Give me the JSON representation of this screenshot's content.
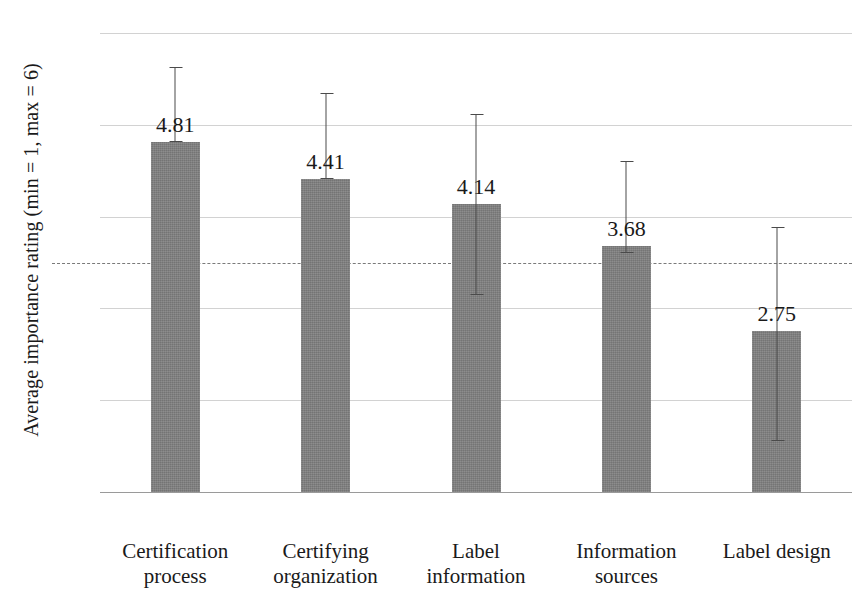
{
  "chart_data": {
    "type": "bar",
    "title": "",
    "xlabel": "",
    "ylabel": "Average importance rating (min = 1, max = 6)",
    "ylim": [
      1,
      6
    ],
    "yticks": [
      6,
      5,
      4,
      3,
      2,
      1
    ],
    "grid": true,
    "legend": "none",
    "categories": [
      "Certification process",
      "Certifying organization",
      "Label information",
      "Information sources",
      "Label design"
    ],
    "values": [
      4.81,
      4.41,
      4.14,
      3.68,
      2.75
    ],
    "value_labels": [
      "4.81",
      "4.41",
      "4.14",
      "3.68",
      "2.75"
    ],
    "error_bars": [
      {
        "upper": 5.63,
        "lower": 4.81
      },
      {
        "upper": 5.35,
        "lower": 4.41
      },
      {
        "upper": 5.12,
        "lower": 3.15
      },
      {
        "upper": 4.61,
        "lower": 3.6
      },
      {
        "upper": 3.89,
        "lower": 1.55
      }
    ],
    "annotations": [
      {
        "name": "midpoint",
        "label": "midpoint",
        "value": 3.5,
        "style": "dashed-horizontal-line"
      }
    ],
    "colors": {
      "bar_fill": "#808080",
      "gridline": "#d2d2d2",
      "axis": "#9a9a9a",
      "errorbar": "#4a4a4a",
      "text": "#1a1a1a",
      "background": "#ffffff"
    }
  },
  "axis": {
    "y_title": "Average importance rating (min = 1, max = 6)",
    "tick_labels": [
      "6",
      "5",
      "4",
      "3",
      "2",
      "1"
    ],
    "midpoint_label": "midpoint"
  },
  "category_labels": [
    {
      "line1": "Certification",
      "line2": "process"
    },
    {
      "line1": "Certifying",
      "line2": "organization"
    },
    {
      "line1": "Label",
      "line2": "information"
    },
    {
      "line1": "Information",
      "line2": "sources"
    },
    {
      "line1": "Label design",
      "line2": ""
    }
  ]
}
